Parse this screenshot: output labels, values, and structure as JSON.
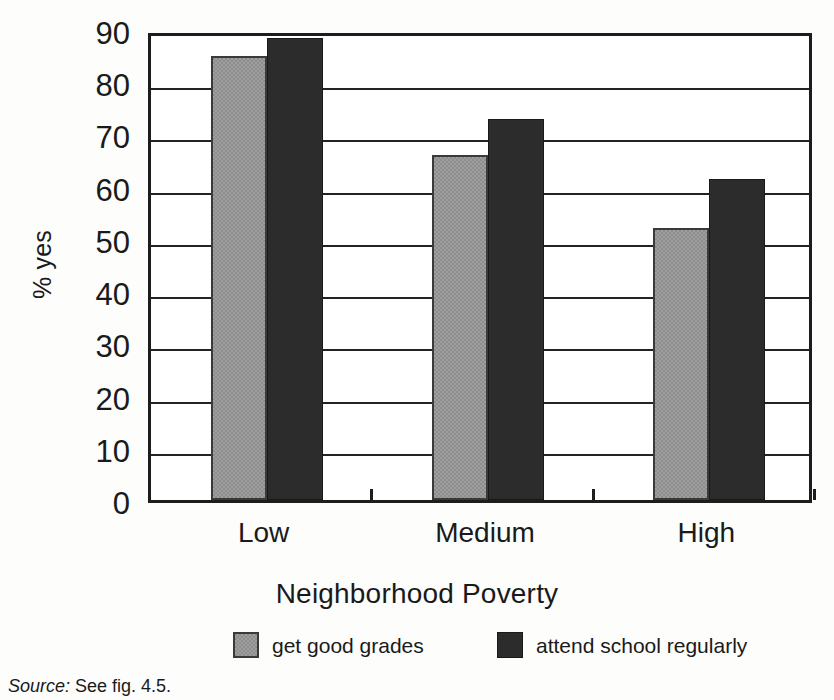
{
  "chart_data": {
    "type": "bar",
    "title": "",
    "xlabel": "Neighborhood Poverty",
    "ylabel": "% yes",
    "categories": [
      "Low",
      "Medium",
      "High"
    ],
    "series": [
      {
        "name": "get good grades",
        "color": "#8d8d8d",
        "values": [
          85,
          66,
          52
        ]
      },
      {
        "name": "attend school regularly",
        "color": "#2c2c2c",
        "values": [
          88.5,
          73,
          61.5
        ]
      }
    ],
    "ylim": [
      0,
      90
    ],
    "yticks": [
      0,
      10,
      20,
      30,
      40,
      50,
      60,
      70,
      80,
      90
    ],
    "ytick_labels": [
      "0",
      "10",
      "20",
      "30",
      "40",
      "50",
      "60",
      "70",
      "80",
      "90"
    ],
    "grid": true,
    "grid_axis": "y",
    "legend_position": "bottom"
  },
  "legend": {
    "items": [
      {
        "label": "get good grades",
        "swatch": "light-gray-swatch"
      },
      {
        "label": "attend school regularly",
        "swatch": "dark-swatch"
      }
    ]
  },
  "source_note": {
    "keyword": "Source:",
    "text": " See fig. 4.5."
  },
  "colors": {
    "series_light": "#8d8d8d",
    "series_dark": "#2c2c2c",
    "axis": "#1d1d1d",
    "background": "#fdfdfc"
  }
}
